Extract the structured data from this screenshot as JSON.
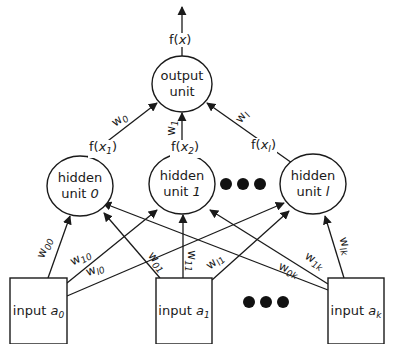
{
  "diagram": {
    "title": "",
    "colors": {
      "stroke": "#1a1a1a",
      "background": "#ffffff",
      "dots": "#111111"
    },
    "output": {
      "label_line1": "output",
      "label_line2": "unit",
      "output_label_fn": "f(",
      "output_label_var": "x",
      "output_label_close": ")"
    },
    "hidden_to_output": [
      {
        "activation_fn": "f(",
        "activation_var": "x",
        "activation_sub": "1",
        "activation_close": ")",
        "weight": "w",
        "weight_sub": "0"
      },
      {
        "activation_fn": "f(",
        "activation_var": "x",
        "activation_sub": "2",
        "activation_close": ")",
        "weight": "w",
        "weight_sub": "1"
      },
      {
        "activation_fn": "f(",
        "activation_var": "x",
        "activation_sub": "l",
        "activation_close": ")",
        "weight": "w",
        "weight_sub": "l"
      }
    ],
    "hidden_units": [
      {
        "line1": "hidden",
        "line2_prefix": "unit ",
        "index": "0"
      },
      {
        "line1": "hidden",
        "line2_prefix": "unit ",
        "index": "1"
      },
      {
        "line1": "hidden",
        "line2_prefix": "unit ",
        "index": "l"
      }
    ],
    "inputs": [
      {
        "prefix": "input ",
        "var": "a",
        "sub": "0"
      },
      {
        "prefix": "input ",
        "var": "a",
        "sub": "1"
      },
      {
        "prefix": "input ",
        "var": "a",
        "sub": "k"
      }
    ],
    "input_to_hidden_weights": [
      {
        "w": "w",
        "sub": "00"
      },
      {
        "w": "w",
        "sub": "10"
      },
      {
        "w": "w",
        "sub": "l0"
      },
      {
        "w": "w",
        "sub": "01"
      },
      {
        "w": "w",
        "sub": "11"
      },
      {
        "w": "w",
        "sub": "l1"
      },
      {
        "w": "w",
        "sub": "0k"
      },
      {
        "w": "w",
        "sub": "1k"
      },
      {
        "w": "w",
        "sub": "lk"
      }
    ],
    "ellipsis_hidden": "●●●",
    "ellipsis_inputs": "●●●"
  }
}
